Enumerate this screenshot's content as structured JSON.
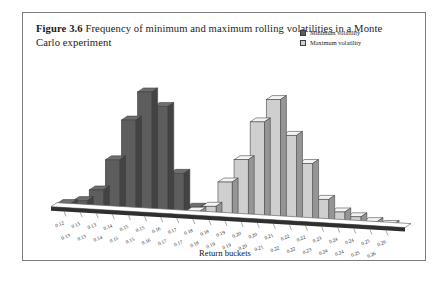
{
  "figure": {
    "label": "Figure 3.6",
    "caption": "Frequency of minimum and maximum rolling volatilities in a Monte Carlo experiment"
  },
  "legend": {
    "position": "top-right",
    "items": [
      {
        "label": "Minimum volatility",
        "color": "#5d5d5d"
      },
      {
        "label": "Maximum volatility",
        "color": "#cfcfcf"
      }
    ]
  },
  "axis": {
    "xlabel": "Return buckets"
  },
  "chart_data": {
    "type": "bar",
    "title": "Frequency of minimum and maximum rolling volatilities in a Monte Carlo experiment",
    "xlabel": "Return buckets",
    "ylabel": "",
    "grid": false,
    "legend_position": "top-right",
    "style": "3d-perspective-histogram",
    "categories": [
      "0.12",
      "0.13",
      "0.13",
      "0.14",
      "0.15",
      "0.15",
      "0.16",
      "0.17",
      "0.18",
      "0.18",
      "0.19",
      "0.20",
      "0.20",
      "0.21",
      "0.22",
      "0.22",
      "0.23",
      "0.24",
      "0.24",
      "0.25",
      "0.26"
    ],
    "categories_row2": [
      "0.13",
      "0.13",
      "0.14",
      "0.15",
      "0.15",
      "0.16",
      "0.17",
      "0.17",
      "0.18",
      "0.19",
      "0.19",
      "0.20",
      "0.21",
      "0.22",
      "0.22",
      "0.23",
      "0.24",
      "0.24",
      "0.25",
      "0.26"
    ],
    "series": [
      {
        "name": "Minimum volatility",
        "color": "#5d5d5d",
        "values": [
          2,
          4,
          10,
          26,
          47,
          62,
          55,
          21,
          4,
          2,
          1,
          0,
          0,
          0,
          0,
          0,
          0,
          0,
          0,
          0,
          0
        ]
      },
      {
        "name": "Maximum volatility",
        "color": "#cfcfcf",
        "values": [
          0,
          0,
          0,
          0,
          0,
          0,
          0,
          0,
          2,
          5,
          18,
          30,
          50,
          62,
          44,
          30,
          12,
          6,
          4,
          2,
          1
        ]
      }
    ],
    "ylim": [
      0,
      66
    ]
  }
}
